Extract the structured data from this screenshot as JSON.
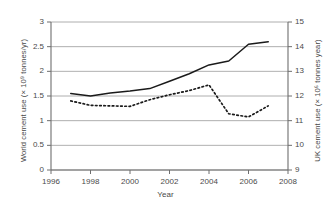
{
  "chart_data": {
    "type": "line",
    "title": "",
    "xlabel": "Year",
    "x": [
      1997,
      1998,
      1999,
      2000,
      2001,
      2002,
      2003,
      2004,
      2005,
      2006,
      2007
    ],
    "xlim": [
      1996,
      2008
    ],
    "xticks": [
      "1996",
      "1998",
      "2000",
      "2002",
      "2004",
      "2006",
      "2008"
    ],
    "xtick_values": [
      1996,
      1998,
      2000,
      2002,
      2004,
      2006,
      2008
    ],
    "grid": true,
    "legend": "none",
    "axes": [
      {
        "side": "left",
        "label": "World cement use (× 10⁹ tonnes/yr)",
        "ylim": [
          0,
          3
        ],
        "yticks": [
          "0",
          "0.5",
          "1",
          "1.5",
          "2",
          "2.5",
          "3"
        ],
        "ytick_values": [
          0,
          0.5,
          1,
          1.5,
          2,
          2.5,
          3
        ]
      },
      {
        "side": "right",
        "label": "UK cement use (× 10⁶ tonnes year)",
        "ylim": [
          9,
          15
        ],
        "yticks": [
          "9",
          "10",
          "11",
          "12",
          "13",
          "14",
          "15"
        ],
        "ytick_values": [
          9,
          10,
          11,
          12,
          13,
          14,
          15
        ]
      }
    ],
    "series": [
      {
        "name": "World cement use",
        "axis": "left",
        "style": "solid",
        "color": "#1a1a1a",
        "values": [
          1.55,
          1.5,
          1.56,
          1.6,
          1.65,
          1.8,
          1.95,
          2.13,
          2.21,
          2.55,
          2.6
        ]
      },
      {
        "name": "UK cement use",
        "axis": "right",
        "style": "dotted",
        "color": "#1a1a1a",
        "values": [
          11.8,
          11.62,
          11.6,
          11.58,
          11.85,
          12.05,
          12.22,
          12.45,
          11.28,
          11.15,
          11.6
        ]
      }
    ]
  }
}
